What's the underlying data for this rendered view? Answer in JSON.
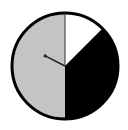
{
  "chart_data": {
    "type": "pie",
    "title": "",
    "start_angle_deg": 0,
    "direction": "clockwise",
    "slices": [
      {
        "label": "white",
        "value": 12.5,
        "color": "#ffffff"
      },
      {
        "label": "black",
        "value": 37.5,
        "color": "#000000"
      },
      {
        "label": "gray",
        "value": 50.0,
        "color": "#c4c4c4"
      }
    ],
    "categories": [
      "white",
      "black",
      "gray"
    ],
    "values": [
      12.5,
      37.5,
      50.0
    ],
    "legend": "none",
    "border_color": "#000000",
    "needle": {
      "angle_deg": 297,
      "length_ratio": 0.42,
      "color": "#222222"
    },
    "geometry": {
      "cx": 65,
      "cy": 66,
      "r": 53
    }
  }
}
